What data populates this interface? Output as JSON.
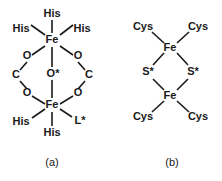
{
  "figure": {
    "background_color": "#ffffff",
    "line_color": "#1a1a1a",
    "panels": [
      {
        "id": "a",
        "caption": "(a)",
        "name": "diiron-oxo-carboxylate-center",
        "atoms": {
          "fe_top": "Fe",
          "fe_bottom": "Fe",
          "oxo_bridge": "O*",
          "o_upper_left": "O",
          "o_upper_right": "O",
          "o_lower_left": "O",
          "o_lower_right": "O",
          "c_left": "C",
          "c_right": "C"
        },
        "ligands": {
          "his_top": "His",
          "his_top_left": "His",
          "his_top_right": "His",
          "his_bottom": "His",
          "his_bottom_left": "His",
          "l_star": "L*"
        }
      },
      {
        "id": "b",
        "caption": "(b)",
        "name": "two-iron-two-sulfur-cluster",
        "atoms": {
          "fe_top": "Fe",
          "fe_bottom": "Fe",
          "s_left": "S*",
          "s_right": "S*"
        },
        "ligands": {
          "cys_top_left": "Cys",
          "cys_top_right": "Cys",
          "cys_bottom_left": "Cys",
          "cys_bottom_right": "Cys"
        }
      }
    ]
  }
}
